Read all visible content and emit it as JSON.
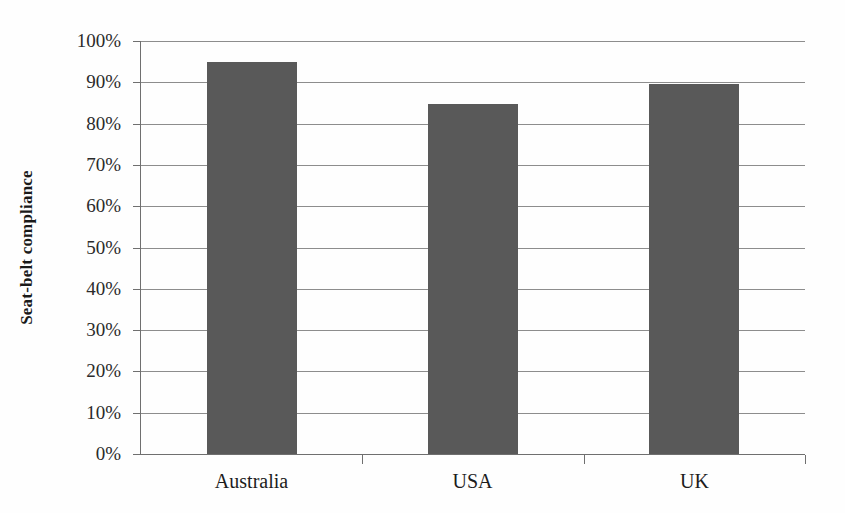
{
  "chart_data": {
    "type": "bar",
    "title": "",
    "subtitle": "",
    "xlabel": "",
    "ylabel": "Seat-belt compliance",
    "categories": [
      "Australia",
      "USA",
      "UK"
    ],
    "values": [
      94.8,
      84.7,
      89.5
    ],
    "series": [
      {
        "name": "Seat-belt compliance",
        "values": [
          94.8,
          84.7,
          89.5
        ],
        "color": "#595959"
      }
    ],
    "ylim": [
      0,
      100
    ],
    "ytick_values": [
      100,
      90,
      80,
      70,
      60,
      50,
      40,
      30,
      20,
      10,
      0
    ],
    "ytick_labels": [
      "100%",
      "90%",
      "80%",
      "70%",
      "60%",
      "50%",
      "40%",
      "30%",
      "20%",
      "10%",
      "0%"
    ],
    "grid": true,
    "grid_axis": "y",
    "legend": false,
    "legend_position": "none",
    "annotations": [],
    "colors": {
      "bar_fill": "#595959",
      "gridline": "#8d8d8d",
      "axis_line": "#6f6f6f",
      "text": "#1c1c1c",
      "background": "#fefefe"
    }
  }
}
